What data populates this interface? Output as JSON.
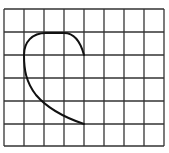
{
  "diagram": {
    "type": "grid-with-curve",
    "grid": {
      "columns": 8,
      "rows": 6,
      "x_lines": [
        4,
        24,
        44,
        64,
        84,
        104,
        124,
        144,
        164
      ],
      "y_lines": [
        9,
        32,
        55,
        78,
        101,
        124,
        146
      ],
      "line_color": "#333333"
    },
    "curve": {
      "description": "Open curve starting at grid point (col 4,row 2), arcing up and left over the top of row 1, then down along column 1, sweeping to end at (col 4,row 5)",
      "grid_points": [
        [
          4,
          2
        ],
        [
          3,
          1
        ],
        [
          2,
          1
        ],
        [
          1,
          2
        ],
        [
          1,
          3
        ],
        [
          2,
          4
        ],
        [
          4,
          5
        ]
      ],
      "path": "M84,55 C80,40 74,33 64,33 L46,33 C32,33 24,42 24,55 C24,70 26,82 36,95 C48,109 66,118 84,124",
      "color": "#111111"
    }
  }
}
